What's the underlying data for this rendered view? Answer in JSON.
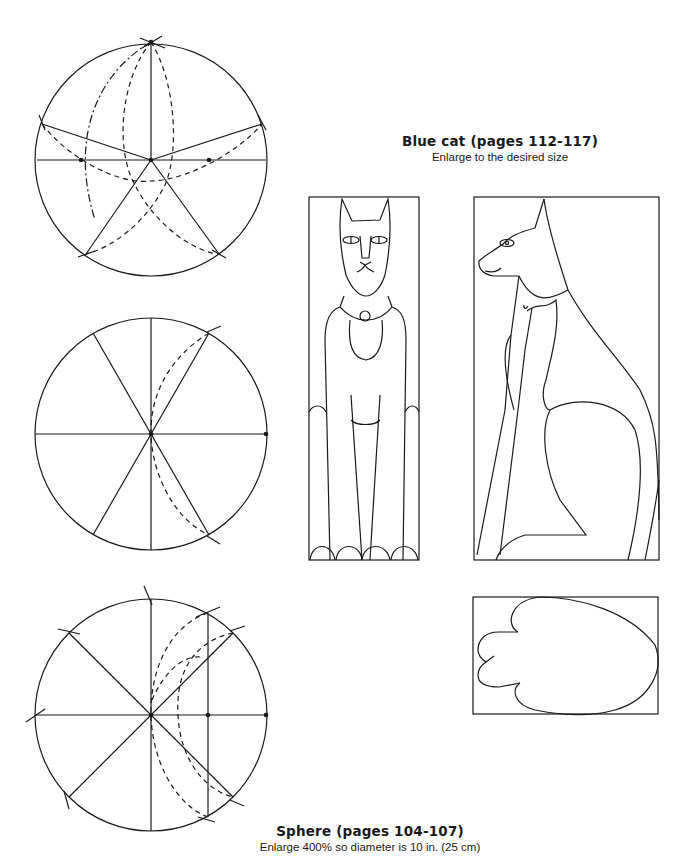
{
  "cat_section": {
    "title": "Blue cat (pages 112-117)",
    "subtitle": "Enlarge to the desired size",
    "templates": [
      "front-view",
      "side-view",
      "paw"
    ]
  },
  "sphere_section": {
    "title": "Sphere (pages 104-107)",
    "subtitle": "Enlarge 400% so diameter is 10 in. (25 cm)",
    "diagrams": [
      "five-point-division",
      "six-point-division",
      "eight-point-division"
    ]
  },
  "colors": {
    "line": "#1a1a1a",
    "background": "#ffffff"
  }
}
